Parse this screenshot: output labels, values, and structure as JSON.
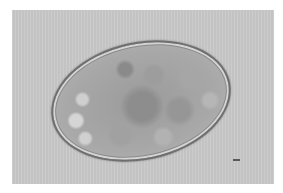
{
  "image": {
    "subject": "micrograph of an oval egg with granular contents",
    "colors": {
      "page_background": "#ffffff",
      "photo_background": "#c9c9c9",
      "egg_interior": "#9b9b9b",
      "egg_shell": "#6f6f6f",
      "scale_mark": "#5a5a5a"
    }
  }
}
